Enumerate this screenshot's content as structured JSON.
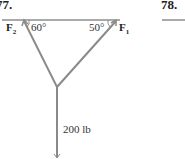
{
  "problems": {
    "left_number": "77.",
    "right_number": "78."
  },
  "diagram": {
    "force_left": {
      "symbol": "F",
      "subscript": "2",
      "angle": "60°"
    },
    "force_right": {
      "symbol": "F",
      "subscript": "1",
      "angle": "50°"
    },
    "load_label": "200 lb",
    "colors": {
      "member": "#8a8a8a",
      "ceiling": "#555555",
      "text": "#333333"
    }
  }
}
